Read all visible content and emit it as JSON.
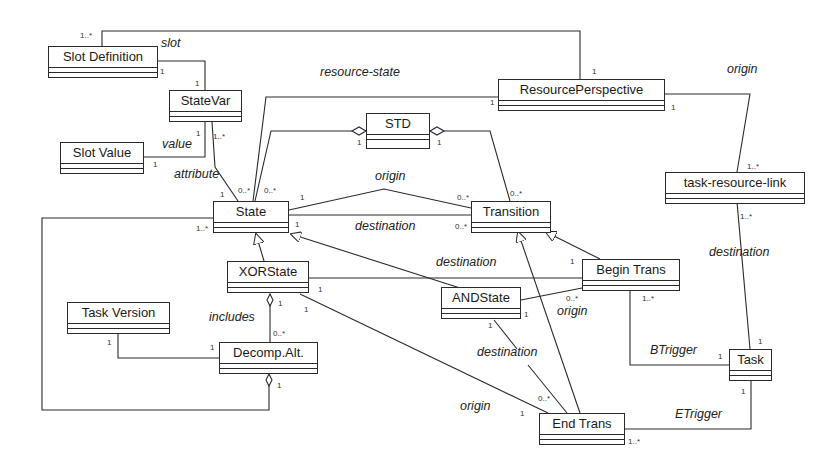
{
  "diagram": {
    "type": "UML class diagram",
    "classes": [
      {
        "id": "slot_definition",
        "name": "Slot Definition",
        "x": 48,
        "y": 46,
        "w": 110
      },
      {
        "id": "statevar",
        "name": "StateVar",
        "x": 169,
        "y": 90,
        "w": 73
      },
      {
        "id": "slot_value",
        "name": "Slot Value",
        "x": 60,
        "y": 142,
        "w": 84
      },
      {
        "id": "resource_perspective",
        "name": "ResourcePerspective",
        "x": 498,
        "y": 79,
        "w": 167
      },
      {
        "id": "std",
        "name": "STD",
        "x": 366,
        "y": 113,
        "w": 64
      },
      {
        "id": "task_resource_link",
        "name": "task-resource-link",
        "x": 665,
        "y": 172,
        "w": 140
      },
      {
        "id": "state",
        "name": "State",
        "x": 213,
        "y": 201,
        "w": 76
      },
      {
        "id": "transition",
        "name": "Transition",
        "x": 471,
        "y": 201,
        "w": 80
      },
      {
        "id": "xorstate",
        "name": "XORState",
        "x": 227,
        "y": 261,
        "w": 82
      },
      {
        "id": "andstate",
        "name": "ANDState",
        "x": 441,
        "y": 287,
        "w": 80
      },
      {
        "id": "begin_trans",
        "name": "Begin Trans",
        "x": 582,
        "y": 259,
        "w": 98
      },
      {
        "id": "task_version",
        "name": "Task Version",
        "x": 67,
        "y": 302,
        "w": 103
      },
      {
        "id": "decomp_alt",
        "name": "Decomp.Alt.",
        "x": 219,
        "y": 342,
        "w": 99
      },
      {
        "id": "task",
        "name": "Task",
        "x": 729,
        "y": 349,
        "w": 43
      },
      {
        "id": "end_trans",
        "name": "End Trans",
        "x": 539,
        "y": 413,
        "w": 86
      }
    ],
    "association_labels": [
      {
        "text": "slot",
        "x": 161,
        "y": 42
      },
      {
        "text": "resource-state",
        "x": 320,
        "y": 71
      },
      {
        "text": "origin",
        "x": 727,
        "y": 68
      },
      {
        "text": "value",
        "x": 162,
        "y": 140
      },
      {
        "text": "attribute",
        "x": 174,
        "y": 170
      },
      {
        "text": "origin",
        "x": 374,
        "y": 171
      },
      {
        "text": "destination",
        "x": 355,
        "y": 219
      },
      {
        "text": "destination",
        "x": 436,
        "y": 256
      },
      {
        "text": "destination",
        "x": 709,
        "y": 246
      },
      {
        "text": "includes",
        "x": 209,
        "y": 311
      },
      {
        "text": "origin",
        "x": 557,
        "y": 305
      },
      {
        "text": "destination",
        "x": 477,
        "y": 346
      },
      {
        "text": "BTrigger",
        "x": 650,
        "y": 344
      },
      {
        "text": "origin",
        "x": 460,
        "y": 400
      },
      {
        "text": "ETrigger",
        "x": 675,
        "y": 408
      }
    ],
    "multiplicities": [
      {
        "text": "1..*",
        "x": 80,
        "y": 31
      },
      {
        "text": "1",
        "x": 160,
        "y": 70
      },
      {
        "text": "1",
        "x": 195,
        "y": 81
      },
      {
        "text": "1",
        "x": 592,
        "y": 68
      },
      {
        "text": "1",
        "x": 491,
        "y": 99
      },
      {
        "text": "1",
        "x": 671,
        "y": 104
      },
      {
        "text": "1",
        "x": 196,
        "y": 131
      },
      {
        "text": "1..*",
        "x": 213,
        "y": 133
      },
      {
        "text": "1",
        "x": 153,
        "y": 162
      },
      {
        "text": "1",
        "x": 357,
        "y": 140
      },
      {
        "text": "1",
        "x": 437,
        "y": 140
      },
      {
        "text": "1..*",
        "x": 747,
        "y": 163
      },
      {
        "text": "1",
        "x": 220,
        "y": 192
      },
      {
        "text": "0..*",
        "x": 238,
        "y": 187
      },
      {
        "text": "0..*",
        "x": 264,
        "y": 187
      },
      {
        "text": "1",
        "x": 300,
        "y": 194
      },
      {
        "text": "0..*",
        "x": 458,
        "y": 194
      },
      {
        "text": "0..*",
        "x": 510,
        "y": 190
      },
      {
        "text": "1..*",
        "x": 196,
        "y": 224
      },
      {
        "text": "1",
        "x": 295,
        "y": 221
      },
      {
        "text": "0..*",
        "x": 455,
        "y": 224
      },
      {
        "text": "1..*",
        "x": 740,
        "y": 212
      },
      {
        "text": "1",
        "x": 570,
        "y": 258
      },
      {
        "text": "1",
        "x": 318,
        "y": 286
      },
      {
        "text": "0..*",
        "x": 566,
        "y": 296
      },
      {
        "text": "1..*",
        "x": 642,
        "y": 296
      },
      {
        "text": "1",
        "x": 524,
        "y": 311
      },
      {
        "text": "1",
        "x": 278,
        "y": 300
      },
      {
        "text": "1",
        "x": 303,
        "y": 305
      },
      {
        "text": "0..*",
        "x": 273,
        "y": 330
      },
      {
        "text": "1",
        "x": 108,
        "y": 339
      },
      {
        "text": "1",
        "x": 210,
        "y": 345
      },
      {
        "text": "1",
        "x": 488,
        "y": 322
      },
      {
        "text": "1",
        "x": 277,
        "y": 382
      },
      {
        "text": "0..*",
        "x": 538,
        "y": 395
      },
      {
        "text": "1",
        "x": 520,
        "y": 410
      },
      {
        "text": "1",
        "x": 758,
        "y": 338
      },
      {
        "text": "1",
        "x": 718,
        "y": 353
      },
      {
        "text": "1",
        "x": 741,
        "y": 388
      },
      {
        "text": "1..*",
        "x": 628,
        "y": 438
      }
    ]
  }
}
